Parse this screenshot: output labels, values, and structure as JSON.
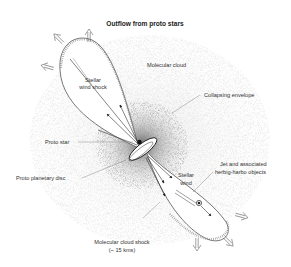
{
  "title": "Outflow from proto stars",
  "labels": {
    "molecular_cloud": "Molecular cloud",
    "stellar_wind_shock_1": "Stellar",
    "stellar_wind_shock_2": "wind shock",
    "collapsing_envelope": "Collapsing envelope",
    "proto_star": "Proto star",
    "jet_1": "Jet and associated",
    "jet_2": "herbig-harbo objects",
    "proto_planetary_disc": "Proto planetary disc",
    "stellar_wind_1": "Stellar",
    "stellar_wind_2": "wind",
    "molecular_cloud_shock_1": "Molecular cloud shock",
    "molecular_cloud_shock_2": "(~ 15 kms)"
  },
  "icons": {
    "outflow_arrow": "hollow-double-arrow",
    "wind_arrow": "solid-arrow",
    "proto_star": "dot",
    "disc": "ellipse"
  },
  "colors": {
    "line": "#555555",
    "text": "#333333",
    "stipple": "#444444"
  }
}
